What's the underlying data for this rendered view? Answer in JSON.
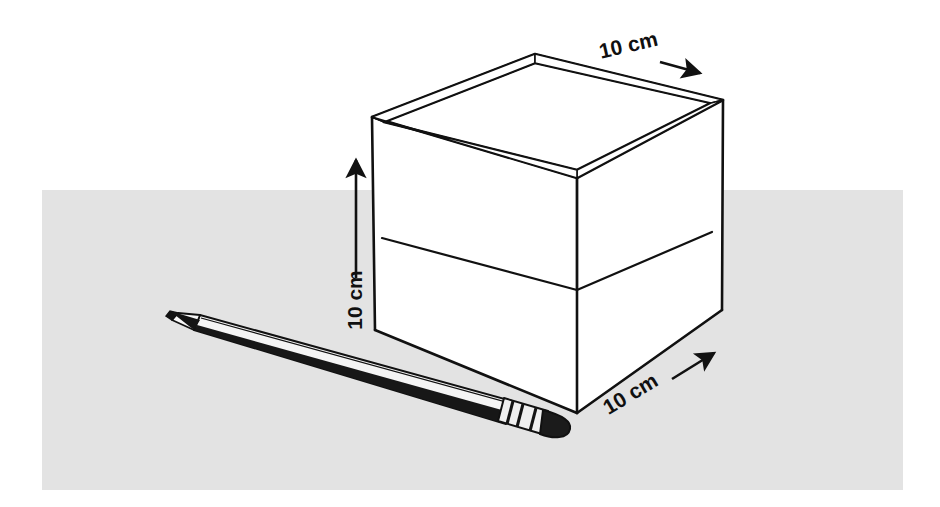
{
  "scene": {
    "title": "Open cube box with pencil for scale",
    "background_color": "#ffffff",
    "surface_color": "#e3e3e3",
    "line_color": "#111111",
    "fill_color": "#ffffff"
  },
  "surface": {
    "name": "table-surface",
    "x": 42,
    "y": 190,
    "width": 861,
    "height": 300
  },
  "cube": {
    "name": "open-cube-box",
    "label": "open cube",
    "outer_rim": {
      "left": [
        372,
        117
      ],
      "back": [
        535,
        54
      ],
      "right": [
        723,
        100
      ],
      "front": [
        577,
        178
      ]
    },
    "inner_rim": {
      "left": [
        384,
        122
      ],
      "back": [
        535,
        63
      ],
      "right": [
        711,
        103
      ],
      "front": [
        577,
        170
      ]
    },
    "bottom": {
      "left": [
        375,
        330
      ],
      "front": [
        577,
        413
      ],
      "right": [
        722,
        310
      ]
    },
    "inner_floor_center": [
      577,
      290
    ],
    "wall_thickness_px": 7
  },
  "pencil": {
    "name": "pencil",
    "label": "pencil",
    "tip": [
      170,
      318
    ],
    "end": [
      572,
      433
    ],
    "body_color": "#f2f2f2",
    "stripe_color": "#161616",
    "eraser_color": "#1c1c1c",
    "ferrule_color": "#ededed"
  },
  "dimensions": [
    {
      "id": "width-top",
      "name": "dimension-label-top",
      "text": "10 cm",
      "value": 10,
      "unit": "cm",
      "text_x": 630,
      "text_y": 52,
      "rotation": -13,
      "arrow_from": [
        660,
        62
      ],
      "arrow_to": [
        700,
        73
      ],
      "axis": "depth"
    },
    {
      "id": "height-left",
      "name": "dimension-label-left",
      "text": "10 cm",
      "value": 10,
      "unit": "cm",
      "text_x": 362,
      "text_y": 300,
      "rotation": -90,
      "arrow_from": [
        356,
        278
      ],
      "arrow_to": [
        356,
        158
      ],
      "axis": "height"
    },
    {
      "id": "width-bottom",
      "name": "dimension-label-bottom",
      "text": "10 cm",
      "value": 10,
      "unit": "cm",
      "text_x": 634,
      "text_y": 400,
      "rotation": -31,
      "arrow_from": [
        672,
        379
      ],
      "arrow_to": [
        716,
        352
      ],
      "axis": "width"
    }
  ]
}
